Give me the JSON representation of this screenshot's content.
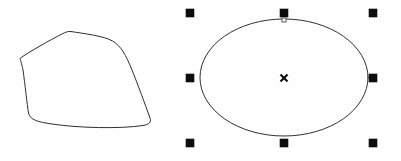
{
  "app": {
    "surface_label": "Vector drawing canvas",
    "background_color": "#fefefe",
    "stroke_color": "#2f2f33",
    "handle_color": "#0d0d0d",
    "canvas_width": 401,
    "canvas_height": 161
  },
  "shapes": [
    {
      "id": "freeform-blob",
      "label": "Freeform closed curve",
      "type": "path",
      "selected": false,
      "stroke": "#2f2f33",
      "fill": "none",
      "bounds": {
        "x": 18,
        "y": 30,
        "width": 134,
        "height": 96
      },
      "path": "M 70.5 31.5 C 84 33.5 104 36 112.5 41 C 121 46 126 55 132 70 C 138 85 145 104 150 118 C 151.5 122.5 149 124.5 143 125.5 C 120 129 78 128 52 124 C 38 122 30 120 28.5 113 C 27 104 25 84 23 70 C 21.5 62.5 20 59.5 20.2 58.2 C 29 52 50 40 62 34 C 66 32 68 31.2 70.5 31.5 Z"
    },
    {
      "id": "ellipse-shape",
      "label": "Ellipse",
      "type": "ellipse",
      "selected": true,
      "stroke": "#2f2f33",
      "fill": "none",
      "center": {
        "cx": 284,
        "cy": 77.5
      },
      "radii": {
        "rx": 84,
        "ry": 58.5
      }
    }
  ],
  "selection": {
    "active_shape": "ellipse-shape",
    "bounding_box": {
      "x": 186,
      "y": 9,
      "width": 191,
      "height": 138
    },
    "handle_size": 8,
    "handles": [
      {
        "name": "handle-top-left",
        "position": "top-left",
        "x": 186,
        "y": 9
      },
      {
        "name": "handle-top-center",
        "position": "top-center",
        "x": 280,
        "y": 9
      },
      {
        "name": "handle-top-right",
        "position": "top-right",
        "x": 369,
        "y": 9
      },
      {
        "name": "handle-middle-left",
        "position": "middle-left",
        "x": 186,
        "y": 74
      },
      {
        "name": "handle-middle-right",
        "position": "middle-right",
        "x": 369,
        "y": 74
      },
      {
        "name": "handle-bottom-left",
        "position": "bottom-left",
        "x": 186,
        "y": 139
      },
      {
        "name": "handle-bottom-center",
        "position": "bottom-center",
        "x": 280,
        "y": 139
      },
      {
        "name": "handle-bottom-right",
        "position": "bottom-right",
        "x": 369,
        "y": 139
      }
    ],
    "center_marker": {
      "name": "rotation-center-marker",
      "glyph": "x",
      "x": 284,
      "y": 78,
      "size": 7
    },
    "node_markers": [
      {
        "name": "node-marker-top",
        "x": 284,
        "y": 20,
        "size": 4
      }
    ]
  }
}
